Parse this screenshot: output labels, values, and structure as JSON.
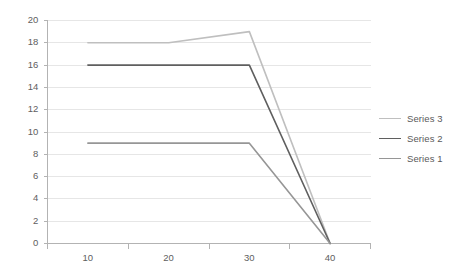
{
  "chart_data": {
    "type": "line",
    "title": "",
    "xlabel": "",
    "ylabel": "",
    "categories": [
      "10",
      "20",
      "30",
      "40"
    ],
    "x": [
      10,
      20,
      30,
      40
    ],
    "ylim": [
      0,
      20
    ],
    "yticks": [
      "0",
      "2",
      "4",
      "6",
      "8",
      "10",
      "12",
      "14",
      "16",
      "18",
      "20"
    ],
    "grid": "horizontal",
    "legend_position": "right",
    "series": [
      {
        "name": "Series 3",
        "values": [
          18,
          18,
          19,
          0
        ],
        "color": "#bfbfbf"
      },
      {
        "name": "Series 2",
        "values": [
          16,
          16,
          16,
          0
        ],
        "color": "#5f5f5f"
      },
      {
        "name": "Series 1",
        "values": [
          9,
          9,
          9,
          0
        ],
        "color": "#969696"
      }
    ],
    "legend_order": [
      "Series 3",
      "Series 2",
      "Series 1"
    ],
    "colors": {
      "background": "#ffffff",
      "gridline": "#e6e6e6",
      "axis": "#b3b3b3",
      "text": "#595959"
    }
  }
}
